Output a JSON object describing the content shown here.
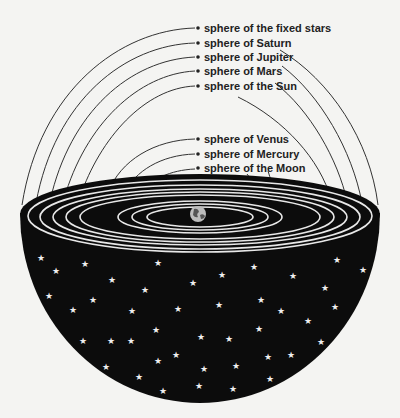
{
  "center_body": "Earth",
  "labels": {
    "fixed_stars": "sphere of the fixed stars",
    "saturn": "sphere of Saturn",
    "jupiter": "sphere of Jupiter",
    "mars": "sphere of Mars",
    "sun": "sphere of the Sun",
    "venus": "sphere of Venus",
    "mercury": "sphere of Mercury",
    "moon": "sphere of the Moon"
  },
  "colors": {
    "background": "#f4f4f2",
    "disc": "#0c0c0c",
    "rings": "#e8e8e8",
    "lines": "#333333"
  }
}
